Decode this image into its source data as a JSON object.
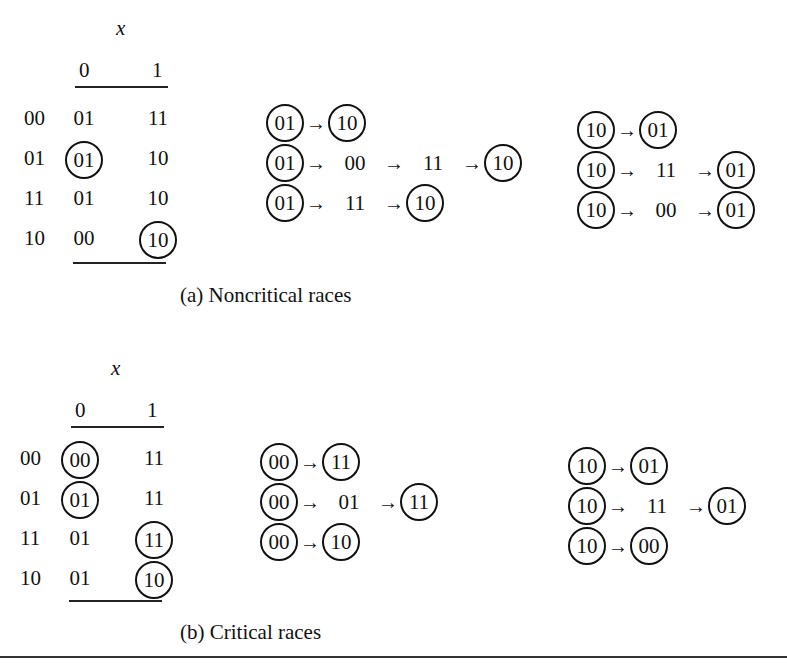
{
  "figure_a": {
    "caption": "(a) Noncritical races",
    "table": {
      "input_label": "x",
      "columns": [
        "0",
        "1"
      ],
      "rows": [
        {
          "state": "00",
          "cells": [
            {
              "v": "01",
              "stable": false
            },
            {
              "v": "11",
              "stable": false
            }
          ]
        },
        {
          "state": "01",
          "cells": [
            {
              "v": "01",
              "stable": true
            },
            {
              "v": "10",
              "stable": false
            }
          ]
        },
        {
          "state": "11",
          "cells": [
            {
              "v": "01",
              "stable": false
            },
            {
              "v": "10",
              "stable": false
            }
          ]
        },
        {
          "state": "10",
          "cells": [
            {
              "v": "00",
              "stable": false
            },
            {
              "v": "10",
              "stable": true
            }
          ]
        }
      ]
    },
    "transitions_left": [
      [
        {
          "v": "01",
          "c": true
        },
        {
          "v": "10",
          "c": true
        }
      ],
      [
        {
          "v": "01",
          "c": true
        },
        {
          "v": "00",
          "c": false
        },
        {
          "v": "11",
          "c": false
        },
        {
          "v": "10",
          "c": true
        }
      ],
      [
        {
          "v": "01",
          "c": true
        },
        {
          "v": "11",
          "c": false
        },
        {
          "v": "10",
          "c": true
        }
      ]
    ],
    "transitions_right": [
      [
        {
          "v": "10",
          "c": true
        },
        {
          "v": "01",
          "c": true
        }
      ],
      [
        {
          "v": "10",
          "c": true
        },
        {
          "v": "11",
          "c": false
        },
        {
          "v": "01",
          "c": true
        }
      ],
      [
        {
          "v": "10",
          "c": true
        },
        {
          "v": "00",
          "c": false
        },
        {
          "v": "01",
          "c": true
        }
      ]
    ]
  },
  "figure_b": {
    "caption": "(b) Critical races",
    "table": {
      "input_label": "x",
      "columns": [
        "0",
        "1"
      ],
      "rows": [
        {
          "state": "00",
          "cells": [
            {
              "v": "00",
              "stable": true
            },
            {
              "v": "11",
              "stable": false
            }
          ]
        },
        {
          "state": "01",
          "cells": [
            {
              "v": "01",
              "stable": true
            },
            {
              "v": "11",
              "stable": false
            }
          ]
        },
        {
          "state": "11",
          "cells": [
            {
              "v": "01",
              "stable": false
            },
            {
              "v": "11",
              "stable": true
            }
          ]
        },
        {
          "state": "10",
          "cells": [
            {
              "v": "01",
              "stable": false
            },
            {
              "v": "10",
              "stable": true
            }
          ]
        }
      ]
    },
    "transitions_left": [
      [
        {
          "v": "00",
          "c": true
        },
        {
          "v": "11",
          "c": true
        }
      ],
      [
        {
          "v": "00",
          "c": true
        },
        {
          "v": "01",
          "c": false
        },
        {
          "v": "11",
          "c": true
        }
      ],
      [
        {
          "v": "00",
          "c": true
        },
        {
          "v": "10",
          "c": true
        }
      ]
    ],
    "transitions_right": [
      [
        {
          "v": "10",
          "c": true
        },
        {
          "v": "01",
          "c": true
        }
      ],
      [
        {
          "v": "10",
          "c": true
        },
        {
          "v": "11",
          "c": false
        },
        {
          "v": "01",
          "c": true
        }
      ],
      [
        {
          "v": "10",
          "c": true
        },
        {
          "v": "00",
          "c": true
        }
      ]
    ]
  },
  "arrow_glyph": "→"
}
